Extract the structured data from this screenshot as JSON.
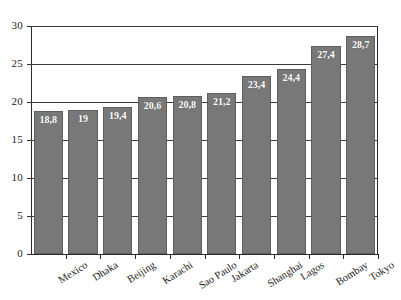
{
  "chart_data": {
    "type": "bar",
    "title": "",
    "subtitle": "",
    "xlabel": "",
    "ylabel": "",
    "categories": [
      "Mexico",
      "Dhaka",
      "Beijing",
      "Karachi",
      "Sao Paulo",
      "Jakarta",
      "Shanghai",
      "Lagos",
      "Bombay",
      "Tokyo"
    ],
    "values": [
      18.8,
      19,
      19.4,
      20.6,
      20.8,
      21.2,
      23.4,
      24.4,
      27.4,
      28.7
    ],
    "value_labels": [
      "18,8",
      "19",
      "19,4",
      "20,6",
      "20,8",
      "21,2",
      "23,4",
      "24,4",
      "27,4",
      "28,7"
    ],
    "ylim": [
      0,
      30
    ],
    "ytick_labels": [
      "0",
      "5",
      "10",
      "15",
      "20",
      "25",
      "30"
    ],
    "ytick_values": [
      0,
      5,
      10,
      15,
      20,
      25,
      30
    ],
    "grid": true,
    "gridlines_full": [
      20,
      25,
      30
    ],
    "gridlines_partial": [
      5,
      10,
      15
    ],
    "legend": false,
    "legend_position": "none",
    "bar_color": "#787878",
    "bar_border_color": "#5e5e5e",
    "value_label_color": "#ffffff",
    "axis_color": "#2b2b2b",
    "background_color": "#ffffff",
    "xlabel_rotation_deg": -32
  }
}
